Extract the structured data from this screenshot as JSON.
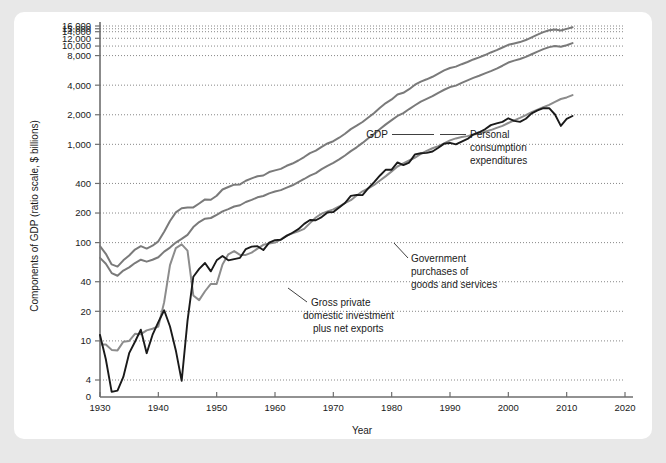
{
  "page": {
    "background_color": "#e8e8e8",
    "card_color": "#ffffff"
  },
  "chart_data": {
    "type": "line",
    "title": "",
    "xlabel": "Year",
    "ylabel": "Components of GDP (ratio scale, $ billions)",
    "scale": "log",
    "grid": true,
    "legend_position": "inline-annotations",
    "xlim": [
      1928,
      2022
    ],
    "ylim": [
      4,
      16000
    ],
    "xticks": [
      1930,
      1940,
      1950,
      1960,
      1970,
      1980,
      1990,
      2000,
      2010,
      2020
    ],
    "xtick_labels": [
      "1930",
      "1940",
      "1950",
      "1960",
      "1970",
      "1980",
      "1990",
      "2000",
      "2010",
      "2020"
    ],
    "yticks": [
      4,
      10,
      20,
      40,
      100,
      200,
      400,
      1000,
      2000,
      4000,
      8000,
      10000,
      12000,
      14000,
      15000,
      16000
    ],
    "ytick_labels": [
      "4",
      "10",
      "20",
      "40",
      "100",
      "200",
      "400",
      "1,000",
      "2,000",
      "4,000",
      "8,000",
      "10,000",
      "12,000",
      "14,000",
      "15,000",
      "16,000"
    ],
    "zero_tick_label": "0",
    "colors": {
      "gdp": "#7a7a7a",
      "personal_consumption": "#7a7a7a",
      "government": "#8c8c8c",
      "gross_private": "#1a1a1a",
      "gridline": "#555555",
      "axis": "#6e6e6e"
    },
    "series": [
      {
        "name": "GDP",
        "color": "#7a7a7a",
        "label": "GDP",
        "x": [
          1930,
          1931,
          1932,
          1933,
          1934,
          1935,
          1936,
          1937,
          1938,
          1939,
          1940,
          1941,
          1942,
          1943,
          1944,
          1945,
          1946,
          1947,
          1948,
          1949,
          1950,
          1951,
          1952,
          1953,
          1954,
          1955,
          1956,
          1957,
          1958,
          1959,
          1960,
          1961,
          1962,
          1963,
          1964,
          1965,
          1966,
          1967,
          1968,
          1969,
          1970,
          1971,
          1972,
          1973,
          1974,
          1975,
          1976,
          1977,
          1978,
          1979,
          1980,
          1981,
          1982,
          1983,
          1984,
          1985,
          1986,
          1987,
          1988,
          1989,
          1990,
          1991,
          1992,
          1993,
          1994,
          1995,
          1996,
          1997,
          1998,
          1999,
          2000,
          2001,
          2002,
          2003,
          2004,
          2005,
          2006,
          2007,
          2008,
          2009,
          2010,
          2011
        ],
        "y": [
          92,
          77,
          60,
          57,
          66,
          74,
          85,
          92,
          87,
          93,
          103,
          129,
          166,
          203,
          224,
          228,
          228,
          250,
          275,
          273,
          300,
          347,
          368,
          389,
          391,
          426,
          450,
          474,
          482,
          522,
          543,
          563,
          605,
          638,
          685,
          743,
          815,
          862,
          943,
          1020,
          1076,
          1168,
          1282,
          1429,
          1549,
          1689,
          1878,
          2086,
          2357,
          2632,
          2863,
          3211,
          3345,
          3638,
          4041,
          4347,
          4590,
          4870,
          5253,
          5658,
          5980,
          6174,
          6539,
          6879,
          7309,
          7664,
          8100,
          8609,
          9089,
          9661,
          10290,
          10625,
          10980,
          11512,
          12277,
          13095,
          13858,
          14480,
          14720,
          14418,
          14958,
          15534
        ]
      },
      {
        "name": "Personal consumption expenditures",
        "color": "#7a7a7a",
        "label": "Personal consumption expenditures",
        "x": [
          1930,
          1931,
          1932,
          1933,
          1934,
          1935,
          1936,
          1937,
          1938,
          1939,
          1940,
          1941,
          1942,
          1943,
          1944,
          1945,
          1946,
          1947,
          1948,
          1949,
          1950,
          1951,
          1952,
          1953,
          1954,
          1955,
          1956,
          1957,
          1958,
          1959,
          1960,
          1961,
          1962,
          1963,
          1964,
          1965,
          1966,
          1967,
          1968,
          1969,
          1970,
          1971,
          1972,
          1973,
          1974,
          1975,
          1976,
          1977,
          1978,
          1979,
          1980,
          1981,
          1982,
          1983,
          1984,
          1985,
          1986,
          1987,
          1988,
          1989,
          1990,
          1991,
          1992,
          1993,
          1994,
          1995,
          1996,
          1997,
          1998,
          1999,
          2000,
          2001,
          2002,
          2003,
          2004,
          2005,
          2006,
          2007,
          2008,
          2009,
          2010,
          2011
        ],
        "y": [
          70,
          61,
          49,
          46,
          52,
          56,
          62,
          67,
          64,
          67,
          71,
          81,
          89,
          100,
          109,
          120,
          144,
          162,
          175,
          178,
          192,
          208,
          219,
          233,
          240,
          259,
          272,
          289,
          298,
          317,
          331,
          342,
          363,
          383,
          412,
          444,
          481,
          509,
          559,
          604,
          648,
          702,
          770,
          852,
          933,
          1034,
          1152,
          1278,
          1430,
          1596,
          1762,
          1944,
          2079,
          2286,
          2498,
          2722,
          2898,
          3092,
          3346,
          3592,
          3826,
          3960,
          4215,
          4471,
          4741,
          4984,
          5268,
          5560,
          5903,
          6307,
          6792,
          7103,
          7384,
          7765,
          8260,
          8794,
          9304,
          9751,
          10014,
          9847,
          10202,
          10726
        ]
      },
      {
        "name": "Government purchases of goods and services",
        "color": "#8c8c8c",
        "label": "Government purchases of goods and services",
        "x": [
          1930,
          1931,
          1932,
          1933,
          1934,
          1935,
          1936,
          1937,
          1938,
          1939,
          1940,
          1941,
          1942,
          1943,
          1944,
          1945,
          1946,
          1947,
          1948,
          1949,
          1950,
          1951,
          1952,
          1953,
          1954,
          1955,
          1956,
          1957,
          1958,
          1959,
          1960,
          1961,
          1962,
          1963,
          1964,
          1965,
          1966,
          1967,
          1968,
          1969,
          1970,
          1971,
          1972,
          1973,
          1974,
          1975,
          1976,
          1977,
          1978,
          1979,
          1980,
          1981,
          1982,
          1983,
          1984,
          1985,
          1986,
          1987,
          1988,
          1989,
          1990,
          1991,
          1992,
          1993,
          1994,
          1995,
          1996,
          1997,
          1998,
          1999,
          2000,
          2001,
          2002,
          2003,
          2004,
          2005,
          2006,
          2007,
          2008,
          2009,
          2010,
          2011
        ],
        "y": [
          9.2,
          9.2,
          8.1,
          8.0,
          9.8,
          10.0,
          11.8,
          11.7,
          12.8,
          13.3,
          14.0,
          24.8,
          59.0,
          88.0,
          96.0,
          83.0,
          29.0,
          26.0,
          32.0,
          38.0,
          38.0,
          60.0,
          76.0,
          82.0,
          75.0,
          75.0,
          79.0,
          87.0,
          95.0,
          98.0,
          100,
          108,
          118,
          124,
          130,
          138,
          158,
          180,
          197,
          208,
          218,
          233,
          253,
          270,
          302,
          333,
          357,
          386,
          428,
          475,
          531,
          595,
          639,
          685,
          734,
          799,
          857,
          912,
          960,
          1022,
          1097,
          1149,
          1185,
          1212,
          1257,
          1288,
          1341,
          1397,
          1471,
          1540,
          1648,
          1751,
          1859,
          1982,
          2122,
          2258,
          2386,
          2521,
          2710,
          2893,
          3001,
          3168
        ]
      },
      {
        "name": "Gross private domestic investment plus net exports",
        "color": "#1a1a1a",
        "label": "Gross private domestic investment plus net exports",
        "x": [
          1930,
          1931,
          1932,
          1933,
          1934,
          1935,
          1936,
          1937,
          1938,
          1939,
          1940,
          1941,
          1942,
          1943,
          1944,
          1945,
          1946,
          1947,
          1948,
          1949,
          1950,
          1951,
          1952,
          1953,
          1954,
          1955,
          1956,
          1957,
          1958,
          1959,
          1960,
          1961,
          1962,
          1963,
          1964,
          1965,
          1966,
          1967,
          1968,
          1969,
          1970,
          1971,
          1972,
          1973,
          1974,
          1975,
          1976,
          1977,
          1978,
          1979,
          1980,
          1981,
          1982,
          1983,
          1984,
          1985,
          1986,
          1987,
          1988,
          1989,
          1990,
          1991,
          1992,
          1993,
          1994,
          1995,
          1996,
          1997,
          1998,
          1999,
          2000,
          2001,
          2002,
          2003,
          2004,
          2005,
          2006,
          2007,
          2008,
          2009,
          2010,
          2011
        ],
        "y": [
          11.5,
          6.5,
          1.2,
          1.5,
          4.3,
          7.5,
          9.8,
          13.0,
          7.5,
          11.5,
          15.5,
          20.5,
          14.0,
          8.0,
          3.8,
          16.0,
          45.0,
          54.0,
          62.0,
          51.0,
          66.0,
          73.0,
          66.0,
          68.0,
          70.0,
          86.0,
          91.0,
          92.0,
          84.0,
          100,
          106,
          107,
          117,
          126,
          137,
          155,
          170,
          169,
          182,
          203,
          205,
          228,
          253,
          299,
          306,
          304,
          358,
          412,
          482,
          552,
          552,
          655,
          616,
          653,
          790,
          812,
          818,
          846,
          923,
          1017,
          1033,
          998,
          1066,
          1135,
          1258,
          1328,
          1421,
          1568,
          1637,
          1693,
          1841,
          1733,
          1691,
          1822,
          2068,
          2214,
          2336,
          2332,
          2013,
          1539,
          1817,
          1943
        ]
      }
    ],
    "annotations": [
      {
        "id": "gdp",
        "text": "GDP",
        "align": "right"
      },
      {
        "id": "pce",
        "line1": "Personal",
        "line2": "consumption",
        "line3": "expenditures",
        "align": "left"
      },
      {
        "id": "gov",
        "line1": "Government",
        "line2": "purchases of",
        "line3": "goods and services",
        "align": "left"
      },
      {
        "id": "gpdi",
        "line1": "Gross private",
        "line2": "domestic investment",
        "line3": "plus net exports",
        "align": "left"
      }
    ]
  }
}
